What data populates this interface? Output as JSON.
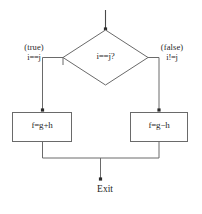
{
  "figure": {
    "type": "flowchart",
    "background_color": "#ffffff",
    "line_color": "#4a4a4a",
    "text_color": "#1f1f1f"
  },
  "entry": {
    "arrow_name": "entry-arrow"
  },
  "decision": {
    "text": "i==j?",
    "shape": "diamond"
  },
  "branches": {
    "true": {
      "condition_label": "(true)",
      "expression": "i==j"
    },
    "false": {
      "condition_label": "(false)",
      "expression": "i!=j"
    }
  },
  "process_boxes": [
    {
      "id": "left",
      "text": "f=g+h"
    },
    {
      "id": "right",
      "text": "f=g−h"
    }
  ],
  "terminator": {
    "text": "Exit"
  },
  "caption": {
    "text": ""
  }
}
